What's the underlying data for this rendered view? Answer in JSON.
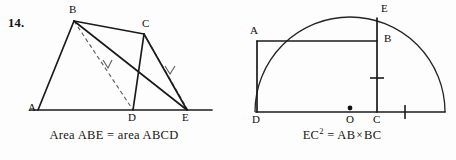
{
  "page": {
    "background_color": "#fdfdfd",
    "ink_color": "#1a1a1a",
    "width": 456,
    "height": 160
  },
  "figures": [
    {
      "number_label": "14.",
      "caption": {
        "prefix": "Area ABE = area ABCD",
        "lhs": "Area ABE",
        "relation": "=",
        "rhs": "area ABCD"
      },
      "type": "geometry-diagram",
      "description": "Quadrilateral ABCD with base line A-D-E; triangle ABE shares area with quadrilateral ABCD",
      "points": [
        {
          "label": "A",
          "x": 38,
          "y": 110,
          "label_x": 28,
          "label_y": 104
        },
        {
          "label": "B",
          "x": 74,
          "y": 21,
          "label_x": 70,
          "label_y": 6
        },
        {
          "label": "C",
          "x": 144,
          "y": 34,
          "label_x": 144,
          "label_y": 22
        },
        {
          "label": "D",
          "x": 133,
          "y": 110,
          "label_x": 129,
          "label_y": 113
        },
        {
          "label": "E",
          "x": 187,
          "y": 110,
          "label_x": 184,
          "label_y": 113
        }
      ],
      "segments": [
        {
          "name": "base-line",
          "from": [
            30,
            110
          ],
          "to": [
            212,
            110
          ],
          "style": "solid"
        },
        {
          "name": "segment-AB",
          "from": [
            38,
            110
          ],
          "to": [
            74,
            21
          ],
          "style": "solid"
        },
        {
          "name": "segment-BC",
          "from": [
            74,
            21
          ],
          "to": [
            144,
            34
          ],
          "style": "solid"
        },
        {
          "name": "segment-CD",
          "from": [
            144,
            34
          ],
          "to": [
            133,
            110
          ],
          "style": "solid"
        },
        {
          "name": "segment-CE",
          "from": [
            144,
            34
          ],
          "to": [
            187,
            110
          ],
          "style": "solid"
        },
        {
          "name": "segment-BE",
          "from": [
            74,
            21
          ],
          "to": [
            187,
            110
          ],
          "style": "solid"
        }
      ],
      "construction_lines": [
        {
          "name": "dashed-BD",
          "from": [
            74,
            21
          ],
          "to": [
            133,
            110
          ],
          "style": "dashed",
          "arrow_at": [
            108,
            67
          ]
        },
        {
          "name": "dashed-CE",
          "from": [
            144,
            34
          ],
          "to": [
            189,
            112
          ],
          "style": "dashed",
          "arrow_at": [
            170,
            73
          ]
        }
      ]
    },
    {
      "number_label": "15.",
      "caption": {
        "lhs": "EC",
        "exponent": "2",
        "relation": "=",
        "rhs_left": "AB",
        "times": "×",
        "rhs_right": "BC"
      },
      "type": "geometry-diagram",
      "description": "Semicircle on diameter D-to-right-end with center O; rectangle ABCD inscribed with E on the arc above C",
      "semicircle": {
        "center_x": 350,
        "center_y": 112,
        "radius": 95
      },
      "points": [
        {
          "label": "A",
          "x": 257,
          "y": 41,
          "label_x": 249,
          "label_y": 27
        },
        {
          "label": "B",
          "x": 377,
          "y": 41,
          "label_x": 384,
          "label_y": 34
        },
        {
          "label": "C",
          "x": 377,
          "y": 112,
          "label_x": 374,
          "label_y": 115
        },
        {
          "label": "D",
          "x": 257,
          "y": 112,
          "label_x": 252,
          "label_y": 115
        },
        {
          "label": "E",
          "x": 377,
          "y": 18,
          "label_x": 381,
          "label_y": 5
        },
        {
          "label": "O",
          "x": 350,
          "y": 112,
          "label_x": 346,
          "label_y": 115
        }
      ],
      "segments": [
        {
          "name": "diameter-line",
          "from": [
            257,
            112
          ],
          "to": [
            445,
            112
          ],
          "style": "solid"
        },
        {
          "name": "segment-AD",
          "from": [
            257,
            41
          ],
          "to": [
            257,
            112
          ],
          "style": "solid"
        },
        {
          "name": "segment-AB",
          "from": [
            257,
            41
          ],
          "to": [
            377,
            41
          ],
          "style": "solid"
        },
        {
          "name": "segment-EC",
          "from": [
            377,
            18
          ],
          "to": [
            377,
            112
          ],
          "style": "solid"
        }
      ],
      "center_dot": {
        "x": 350,
        "y": 108,
        "r": 2.4
      },
      "tick_marks": [
        {
          "name": "tick-on-EC",
          "orientation": "horizontal",
          "x": 377,
          "y": 78,
          "length": 13
        },
        {
          "name": "tick-on-OC-right",
          "orientation": "vertical",
          "x": 405,
          "y": 112,
          "length": 13
        }
      ]
    }
  ]
}
